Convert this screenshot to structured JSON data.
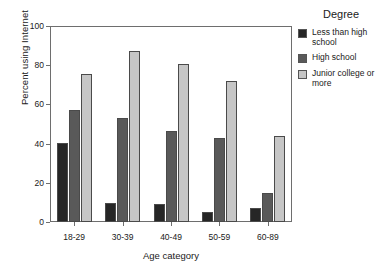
{
  "chart_data": {
    "type": "bar",
    "title": "",
    "xlabel": "Age category",
    "ylabel": "Percent using Internet",
    "categories": [
      "18-29",
      "30-39",
      "40-49",
      "50-59",
      "60-89"
    ],
    "series": [
      {
        "name": "Less than high school",
        "color": "#262626",
        "values": [
          40.5,
          9.5,
          9.0,
          5.0,
          7.0
        ]
      },
      {
        "name": "High school",
        "color": "#595959",
        "values": [
          57.0,
          53.0,
          46.5,
          43.0,
          15.0
        ]
      },
      {
        "name": "Junior college or more",
        "color": "#c6c6c6",
        "values": [
          75.5,
          87.0,
          80.5,
          72.0,
          44.0
        ]
      }
    ],
    "ylim": [
      0,
      100
    ],
    "yticks": [
      0,
      20,
      40,
      60,
      80,
      100
    ],
    "ytick_labels": [
      "0",
      "20",
      "40",
      "60",
      "80",
      "100"
    ],
    "grid": false,
    "legend_position": "right",
    "legend_title": "Degree"
  },
  "legend": {
    "title": "Degree",
    "entries": [
      {
        "label": "Less than high school",
        "color": "#262626"
      },
      {
        "label": "High school",
        "color": "#595959"
      },
      {
        "label": "Junior college or more",
        "color": "#c6c6c6"
      }
    ]
  },
  "axes": {
    "y_title": "Percent using Internet",
    "x_title": "Age category"
  }
}
